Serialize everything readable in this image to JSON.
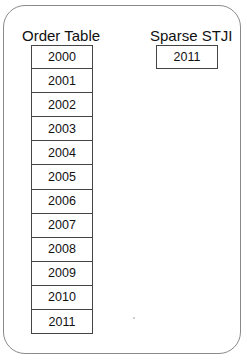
{
  "order_table": {
    "title": "Order Table",
    "rows": [
      "2000",
      "2001",
      "2002",
      "2003",
      "2004",
      "2005",
      "2006",
      "2007",
      "2008",
      "2009",
      "2010",
      "2011"
    ]
  },
  "sparse_stji": {
    "title": "Sparse STJI",
    "rows": [
      "2011"
    ]
  }
}
